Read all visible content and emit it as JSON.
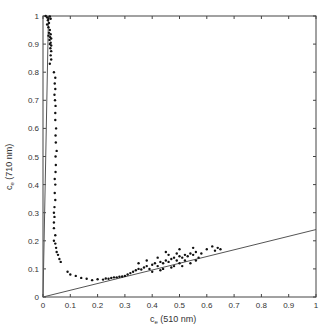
{
  "chart_data": {
    "type": "scatter",
    "title": "",
    "xlabel": "c_e (510 nm)",
    "ylabel": "c_e (710 nm)",
    "xlabel_parts": {
      "main": "c",
      "sub": "e",
      "rest": " (510 nm)"
    },
    "ylabel_parts": {
      "main": "c",
      "sub": "e",
      "rest": " (710 nm)"
    },
    "xlim": [
      0,
      1
    ],
    "ylim": [
      0,
      1
    ],
    "xticks": [
      "0",
      "0.1",
      "0.2",
      "0.3",
      "0.4",
      "0.5",
      "0.6",
      "0.7",
      "0.8",
      "0.9",
      "1"
    ],
    "yticks": [
      "0",
      "0.1",
      "0.2",
      "0.3",
      "0.4",
      "0.5",
      "0.6",
      "0.7",
      "0.8",
      "0.9",
      "1"
    ],
    "grid": false,
    "legend": null,
    "reference_lines": [
      {
        "name": "steep-line",
        "from": [
          0,
          0
        ],
        "to": [
          0.02,
          1.0
        ]
      },
      {
        "name": "shallow-line",
        "from": [
          0,
          0
        ],
        "to": [
          1.0,
          0.24
        ]
      }
    ],
    "series": [
      {
        "name": "measurements",
        "marker": "dot",
        "points": [
          [
            0.01,
            1.0
          ],
          [
            0.015,
            0.995
          ],
          [
            0.02,
            0.99
          ],
          [
            0.025,
            0.998
          ],
          [
            0.018,
            0.985
          ],
          [
            0.022,
            0.975
          ],
          [
            0.028,
            0.99
          ],
          [
            0.015,
            0.97
          ],
          [
            0.02,
            0.96
          ],
          [
            0.025,
            0.95
          ],
          [
            0.022,
            0.94
          ],
          [
            0.028,
            0.935
          ],
          [
            0.02,
            0.93
          ],
          [
            0.026,
            0.925
          ],
          [
            0.03,
            0.92
          ],
          [
            0.024,
            0.915
          ],
          [
            0.028,
            0.905
          ],
          [
            0.025,
            0.9
          ],
          [
            0.03,
            0.895
          ],
          [
            0.027,
            0.885
          ],
          [
            0.03,
            0.875
          ],
          [
            0.028,
            0.86
          ],
          [
            0.03,
            0.845
          ],
          [
            0.025,
            0.83
          ],
          [
            0.04,
            0.8
          ],
          [
            0.045,
            0.78
          ],
          [
            0.043,
            0.76
          ],
          [
            0.045,
            0.74
          ],
          [
            0.042,
            0.72
          ],
          [
            0.044,
            0.7
          ],
          [
            0.046,
            0.68
          ],
          [
            0.045,
            0.655
          ],
          [
            0.045,
            0.63
          ],
          [
            0.048,
            0.6
          ],
          [
            0.046,
            0.575
          ],
          [
            0.047,
            0.55
          ],
          [
            0.05,
            0.52
          ],
          [
            0.046,
            0.5
          ],
          [
            0.047,
            0.47
          ],
          [
            0.046,
            0.445
          ],
          [
            0.043,
            0.42
          ],
          [
            0.045,
            0.4
          ],
          [
            0.043,
            0.37
          ],
          [
            0.045,
            0.345
          ],
          [
            0.042,
            0.32
          ],
          [
            0.04,
            0.3
          ],
          [
            0.042,
            0.285
          ],
          [
            0.04,
            0.265
          ],
          [
            0.04,
            0.245
          ],
          [
            0.045,
            0.22
          ],
          [
            0.04,
            0.2
          ],
          [
            0.045,
            0.19
          ],
          [
            0.048,
            0.175
          ],
          [
            0.05,
            0.16
          ],
          [
            0.055,
            0.15
          ],
          [
            0.06,
            0.135
          ],
          [
            0.065,
            0.125
          ],
          [
            0.09,
            0.09
          ],
          [
            0.1,
            0.08
          ],
          [
            0.12,
            0.075
          ],
          [
            0.14,
            0.068
          ],
          [
            0.16,
            0.065
          ],
          [
            0.18,
            0.06
          ],
          [
            0.2,
            0.063
          ],
          [
            0.22,
            0.062
          ],
          [
            0.23,
            0.066
          ],
          [
            0.24,
            0.065
          ],
          [
            0.25,
            0.068
          ],
          [
            0.26,
            0.07
          ],
          [
            0.27,
            0.07
          ],
          [
            0.28,
            0.072
          ],
          [
            0.29,
            0.073
          ],
          [
            0.3,
            0.075
          ],
          [
            0.31,
            0.08
          ],
          [
            0.32,
            0.085
          ],
          [
            0.33,
            0.09
          ],
          [
            0.34,
            0.095
          ],
          [
            0.35,
            0.1
          ],
          [
            0.36,
            0.098
          ],
          [
            0.37,
            0.105
          ],
          [
            0.38,
            0.11
          ],
          [
            0.39,
            0.1
          ],
          [
            0.4,
            0.115
          ],
          [
            0.41,
            0.12
          ],
          [
            0.42,
            0.11
          ],
          [
            0.43,
            0.125
          ],
          [
            0.44,
            0.12
          ],
          [
            0.45,
            0.13
          ],
          [
            0.46,
            0.125
          ],
          [
            0.47,
            0.135
          ],
          [
            0.48,
            0.14
          ],
          [
            0.49,
            0.13
          ],
          [
            0.5,
            0.145
          ],
          [
            0.51,
            0.14
          ],
          [
            0.52,
            0.15
          ],
          [
            0.53,
            0.145
          ],
          [
            0.54,
            0.155
          ],
          [
            0.55,
            0.15
          ],
          [
            0.56,
            0.16
          ],
          [
            0.57,
            0.14
          ],
          [
            0.58,
            0.155
          ],
          [
            0.6,
            0.17
          ],
          [
            0.62,
            0.18
          ],
          [
            0.63,
            0.165
          ],
          [
            0.64,
            0.175
          ],
          [
            0.65,
            0.17
          ],
          [
            0.38,
            0.13
          ],
          [
            0.4,
            0.09
          ],
          [
            0.42,
            0.14
          ],
          [
            0.44,
            0.1
          ],
          [
            0.46,
            0.15
          ],
          [
            0.48,
            0.11
          ],
          [
            0.5,
            0.12
          ],
          [
            0.52,
            0.13
          ],
          [
            0.54,
            0.12
          ],
          [
            0.56,
            0.13
          ],
          [
            0.35,
            0.12
          ],
          [
            0.45,
            0.16
          ],
          [
            0.5,
            0.17
          ],
          [
            0.55,
            0.175
          ],
          [
            0.47,
            0.105
          ],
          [
            0.43,
            0.095
          ],
          [
            0.49,
            0.155
          ],
          [
            0.51,
            0.11
          ]
        ]
      }
    ]
  }
}
